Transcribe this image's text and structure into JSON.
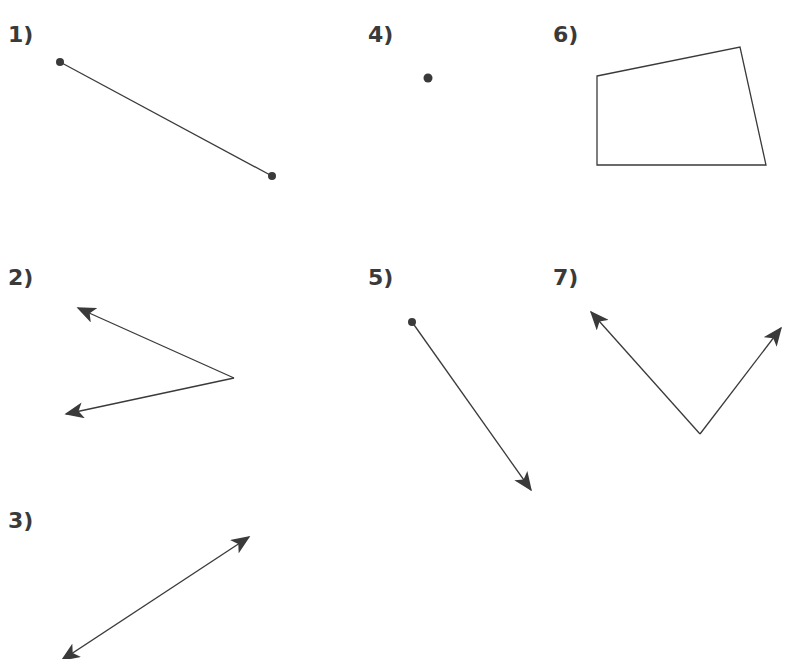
{
  "figures": [
    {
      "id": 1,
      "label": "1)",
      "type": "segment",
      "x": 8,
      "y": 24
    },
    {
      "id": 2,
      "label": "2)",
      "type": "two-rays",
      "x": 8,
      "y": 267
    },
    {
      "id": 3,
      "label": "3)",
      "type": "line",
      "x": 8,
      "y": 510
    },
    {
      "id": 4,
      "label": "4)",
      "type": "point",
      "x": 368,
      "y": 24
    },
    {
      "id": 5,
      "label": "5)",
      "type": "ray",
      "x": 368,
      "y": 267
    },
    {
      "id": 6,
      "label": "6)",
      "type": "quadrilateral",
      "x": 553,
      "y": 24
    },
    {
      "id": 7,
      "label": "7)",
      "type": "angle",
      "x": 553,
      "y": 267
    }
  ],
  "colors": {
    "stroke": "#3a3a3a",
    "label": "#3a3a3a",
    "background": "#ffffff"
  }
}
